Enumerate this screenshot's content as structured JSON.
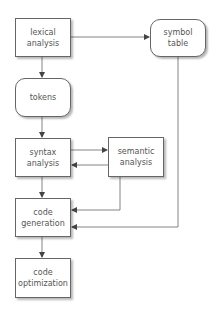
{
  "diagram": {
    "nodes": {
      "lexical": {
        "label": "lexical\nanalysis",
        "shape": "rect"
      },
      "symbol": {
        "label": "symbol\ntable",
        "shape": "rounded"
      },
      "tokens": {
        "label": "tokens",
        "shape": "rounded"
      },
      "syntax": {
        "label": "syntax\nanalysis",
        "shape": "rect"
      },
      "semantic": {
        "label": "semantic\nanalysis",
        "shape": "rect"
      },
      "codegen": {
        "label": "code\ngeneration",
        "shape": "rect"
      },
      "codeopt": {
        "label": "code\noptimization",
        "shape": "rect"
      }
    },
    "edges": [
      {
        "from": "lexical",
        "to": "symbol"
      },
      {
        "from": "lexical",
        "to": "tokens"
      },
      {
        "from": "tokens",
        "to": "syntax"
      },
      {
        "from": "syntax",
        "to": "semantic"
      },
      {
        "from": "semantic",
        "to": "syntax"
      },
      {
        "from": "syntax",
        "to": "codegen"
      },
      {
        "from": "semantic",
        "to": "codegen"
      },
      {
        "from": "symbol",
        "to": "codegen"
      },
      {
        "from": "codegen",
        "to": "codeopt"
      }
    ],
    "colors": {
      "stroke": "#555555",
      "text": "#555555",
      "fill": "#ffffff"
    }
  }
}
